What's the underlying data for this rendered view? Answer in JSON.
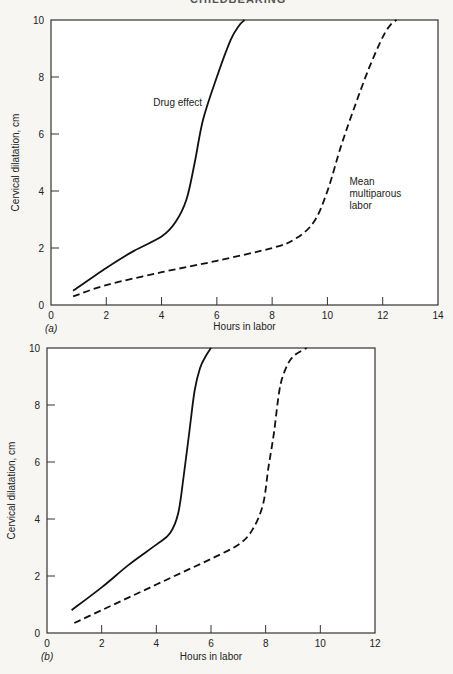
{
  "page": {
    "running_header": "CHILDBEARING"
  },
  "chart_data": [
    {
      "panel": "(a)",
      "type": "line",
      "title": "",
      "xlabel": "Hours in labor",
      "ylabel": "Cervical dilatation, cm",
      "xlim": [
        0,
        14
      ],
      "ylim": [
        0,
        10
      ],
      "xticks": [
        0,
        2,
        4,
        6,
        8,
        10,
        12,
        14
      ],
      "yticks": [
        0,
        2,
        4,
        6,
        8,
        10
      ],
      "grid": false,
      "legend": "inline annotations",
      "series": [
        {
          "name": "Drug effect",
          "style": "solid",
          "label_pos": [
            3.7,
            7.0
          ],
          "points": [
            [
              0.8,
              0.5
            ],
            [
              2.0,
              1.3
            ],
            [
              3.0,
              1.9
            ],
            [
              4.0,
              2.4
            ],
            [
              4.5,
              2.9
            ],
            [
              4.9,
              3.7
            ],
            [
              5.2,
              5.0
            ],
            [
              5.5,
              6.5
            ],
            [
              6.0,
              8.0
            ],
            [
              6.5,
              9.3
            ],
            [
              6.8,
              9.8
            ],
            [
              7.0,
              10.0
            ]
          ]
        },
        {
          "name": "Mean multiparous labor",
          "label_lines": [
            "Mean",
            "multiparous",
            "labor"
          ],
          "style": "dashed",
          "label_pos": [
            10.8,
            4.2
          ],
          "points": [
            [
              0.8,
              0.3
            ],
            [
              2.0,
              0.7
            ],
            [
              4.0,
              1.15
            ],
            [
              6.0,
              1.55
            ],
            [
              8.0,
              2.0
            ],
            [
              8.8,
              2.3
            ],
            [
              9.5,
              2.9
            ],
            [
              10.0,
              4.0
            ],
            [
              10.5,
              5.6
            ],
            [
              11.0,
              7.0
            ],
            [
              11.5,
              8.3
            ],
            [
              12.0,
              9.4
            ],
            [
              12.3,
              9.85
            ],
            [
              12.5,
              10.0
            ]
          ]
        }
      ]
    },
    {
      "panel": "(b)",
      "type": "line",
      "title": "",
      "xlabel": "Hours in labor",
      "ylabel": "Cervical dilatation, cm",
      "xlim": [
        0,
        12
      ],
      "ylim": [
        0,
        10
      ],
      "xticks": [
        0,
        2,
        4,
        6,
        8,
        10,
        12
      ],
      "yticks": [
        0,
        2,
        4,
        6,
        8,
        10
      ],
      "grid": false,
      "series": [
        {
          "name": "Drug effect",
          "style": "solid",
          "points": [
            [
              0.9,
              0.8
            ],
            [
              2.0,
              1.6
            ],
            [
              3.0,
              2.4
            ],
            [
              4.0,
              3.1
            ],
            [
              4.5,
              3.5
            ],
            [
              4.8,
              4.2
            ],
            [
              5.0,
              5.5
            ],
            [
              5.2,
              7.0
            ],
            [
              5.4,
              8.5
            ],
            [
              5.6,
              9.3
            ],
            [
              5.8,
              9.7
            ],
            [
              6.0,
              10.0
            ]
          ]
        },
        {
          "name": "Mean multiparous labor",
          "style": "dashed",
          "points": [
            [
              1.0,
              0.35
            ],
            [
              2.0,
              0.8
            ],
            [
              3.0,
              1.25
            ],
            [
              4.0,
              1.7
            ],
            [
              5.0,
              2.15
            ],
            [
              6.0,
              2.6
            ],
            [
              7.0,
              3.1
            ],
            [
              7.5,
              3.6
            ],
            [
              7.9,
              4.5
            ],
            [
              8.1,
              5.8
            ],
            [
              8.3,
              7.0
            ],
            [
              8.5,
              8.5
            ],
            [
              8.7,
              9.2
            ],
            [
              9.0,
              9.7
            ],
            [
              9.5,
              10.0
            ]
          ]
        }
      ]
    }
  ]
}
